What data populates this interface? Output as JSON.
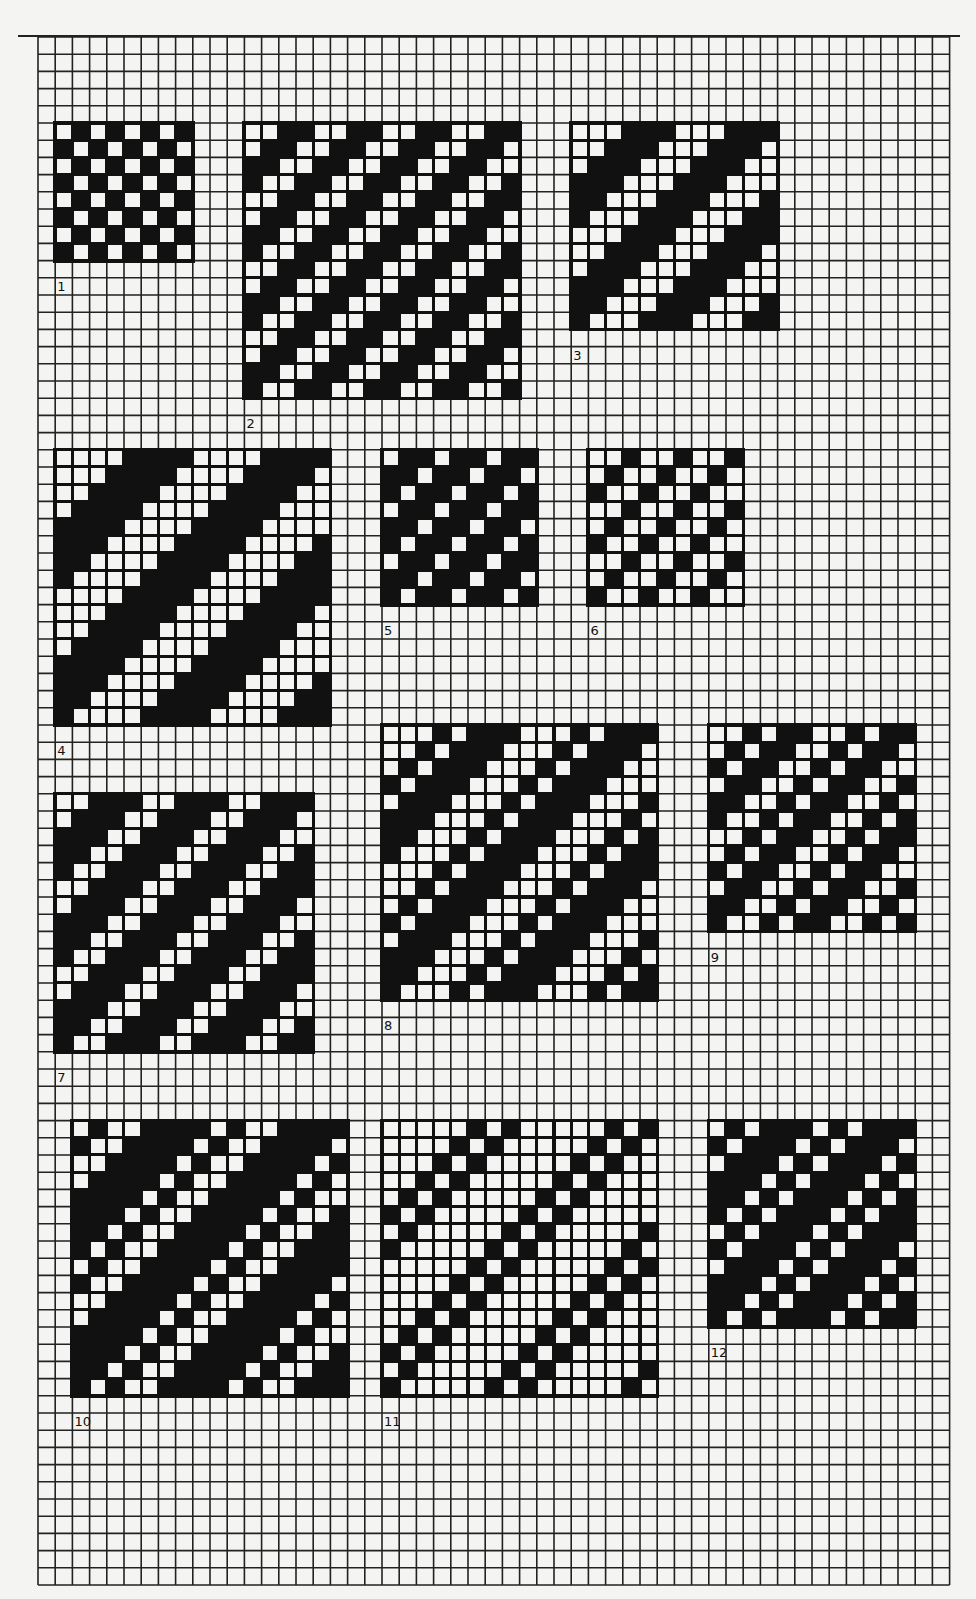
{
  "sheet": {
    "title": "Weave draft diagrams on graph paper",
    "grid": {
      "origin_x": 38,
      "origin_y": 37,
      "cell": 17.2,
      "cols": 53,
      "rows": 90,
      "line_color": "#222222",
      "paper_color": "#f4f4f2"
    },
    "fill_color": "#111111"
  },
  "patterns": [
    {
      "label": "1",
      "col": 1,
      "row": 5,
      "w": 8,
      "h": 8,
      "repeat": [
        "W",
        "B"
      ],
      "label_col": 1,
      "label_row": 14
    },
    {
      "label": "2",
      "col": 12,
      "row": 5,
      "w": 16,
      "h": 16,
      "repeat": [
        "W",
        "W",
        "B",
        "B"
      ],
      "label_col": 12,
      "label_row": 22
    },
    {
      "label": "3",
      "col": 31,
      "row": 5,
      "w": 12,
      "h": 12,
      "repeat": [
        "W",
        "W",
        "W",
        "B",
        "B",
        "B"
      ],
      "label_col": 31,
      "label_row": 18
    },
    {
      "label": "4",
      "col": 1,
      "row": 24,
      "w": 16,
      "h": 16,
      "repeat": [
        "W",
        "W",
        "W",
        "W",
        "B",
        "B",
        "B",
        "B"
      ],
      "label_col": 1,
      "label_row": 41
    },
    {
      "label": "5",
      "col": 20,
      "row": 24,
      "w": 9,
      "h": 9,
      "repeat": [
        "W",
        "B",
        "B"
      ],
      "label_col": 20,
      "label_row": 34
    },
    {
      "label": "6",
      "col": 32,
      "row": 24,
      "w": 9,
      "h": 9,
      "repeat": [
        "W",
        "W",
        "B"
      ],
      "label_col": 32,
      "label_row": 34
    },
    {
      "label": "7",
      "col": 1,
      "row": 44,
      "w": 15,
      "h": 15,
      "repeat": [
        "W",
        "W",
        "B",
        "B",
        "B"
      ],
      "label_col": 1,
      "label_row": 60
    },
    {
      "label": "8",
      "col": 20,
      "row": 40,
      "w": 16,
      "h": 16,
      "repeat": [
        "W",
        "W",
        "W",
        "B",
        "W",
        "B",
        "B",
        "B"
      ],
      "label_col": 20,
      "label_row": 57
    },
    {
      "label": "9",
      "col": 39,
      "row": 40,
      "w": 12,
      "h": 12,
      "repeat": [
        "W",
        "W",
        "B",
        "W",
        "B",
        "B"
      ],
      "label_col": 39,
      "label_row": 53
    },
    {
      "label": "10",
      "col": 2,
      "row": 63,
      "w": 16,
      "h": 16,
      "repeat": [
        "W",
        "B",
        "W",
        "W",
        "B",
        "B",
        "B",
        "B"
      ],
      "label_col": 2,
      "label_row": 80
    },
    {
      "label": "11",
      "col": 20,
      "row": 63,
      "w": 16,
      "h": 16,
      "repeat": [
        "W",
        "W",
        "W",
        "W",
        "W",
        "B",
        "W",
        "B"
      ],
      "label_col": 20,
      "label_row": 80
    },
    {
      "label": "12",
      "col": 39,
      "row": 63,
      "w": 12,
      "h": 12,
      "repeat": [
        "W",
        "B",
        "W",
        "B",
        "B",
        "B"
      ],
      "label_col": 39,
      "label_row": 76
    }
  ]
}
